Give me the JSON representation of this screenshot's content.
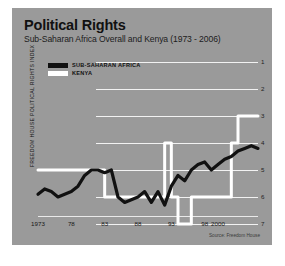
{
  "header": {
    "title": "Political Rights",
    "subtitle": "Sub-Saharan Africa Overall and Kenya (1973 - 2006)"
  },
  "source_note": "Source: Freedom House",
  "colors": {
    "panel_background": "#9a9a9a",
    "gridline": "#f2f2f2",
    "africa_series": "#111111",
    "kenya_series": "#ffffff",
    "page_background": "#ffffff"
  },
  "legend": {
    "position": "top-left",
    "entries": [
      {
        "label": "SUB-SAHARAN AFRICA",
        "color": "#111111"
      },
      {
        "label": "KENYA",
        "color": "#ffffff"
      }
    ]
  },
  "chart_data": {
    "type": "line",
    "title": "Political Rights",
    "subtitle": "Sub-Saharan Africa Overall and Kenya (1973 - 2006)",
    "xlabel": "",
    "ylabel": "FREEDOM HOUSE POLITICAL RIGHTS INDEX",
    "ylim": [
      1,
      7
    ],
    "y_axis_inverted": true,
    "y_ticks": [
      1,
      2,
      3,
      4,
      5,
      6,
      7
    ],
    "y_tick_labels": [
      "1",
      "2",
      "3",
      "4",
      "5",
      "6",
      "7"
    ],
    "y_axis_side": "right",
    "grid": true,
    "xlim": [
      1973,
      2006
    ],
    "x_ticks": [
      1973,
      1978,
      1983,
      1988,
      1993,
      1998,
      2000
    ],
    "x_tick_labels": [
      "1973",
      "78",
      "83",
      "88",
      "93",
      "98",
      "2000"
    ],
    "x": [
      1973,
      1974,
      1975,
      1976,
      1977,
      1978,
      1979,
      1980,
      1981,
      1982,
      1983,
      1984,
      1985,
      1986,
      1987,
      1988,
      1989,
      1990,
      1991,
      1992,
      1993,
      1994,
      1995,
      1996,
      1997,
      1998,
      1999,
      2000,
      2001,
      2002,
      2003,
      2004,
      2005,
      2006
    ],
    "series": [
      {
        "name": "SUB-SAHARAN AFRICA",
        "color": "#111111",
        "values": [
          5.9,
          5.7,
          5.8,
          6.0,
          5.9,
          5.8,
          5.6,
          5.2,
          5.0,
          5.0,
          5.1,
          5.0,
          6.0,
          6.2,
          6.1,
          6.0,
          5.8,
          6.2,
          5.8,
          6.3,
          5.6,
          5.2,
          5.4,
          5.0,
          4.8,
          4.7,
          5.0,
          4.8,
          4.6,
          4.5,
          4.3,
          4.2,
          4.1,
          4.2
        ]
      },
      {
        "name": "KENYA",
        "color": "#ffffff",
        "values": [
          5,
          5,
          5,
          5,
          5,
          5,
          5,
          5,
          5,
          5,
          6,
          6,
          6,
          6,
          6,
          6,
          6,
          6,
          6,
          4,
          6,
          7,
          7,
          6,
          6,
          6,
          6,
          6,
          6,
          4,
          3,
          3,
          3,
          3
        ]
      }
    ]
  }
}
